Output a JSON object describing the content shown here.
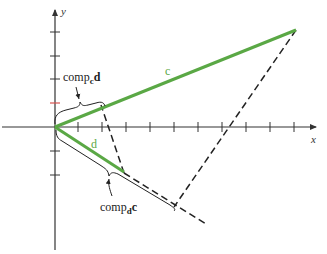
{
  "diagram": {
    "axes": {
      "x_label": "x",
      "y_label": "y",
      "origin": [
        55,
        127
      ],
      "x_ticks_px": [
        78,
        102,
        126,
        150,
        174,
        198,
        222,
        246,
        270,
        294
      ],
      "y_ticks_px": [
        32,
        56,
        79,
        103,
        151,
        175
      ],
      "highlight_tick_y_px": 103,
      "highlight_tick_color": "#d9534f",
      "axis_color": "#333333"
    },
    "vectors": {
      "c": {
        "label": "c",
        "tip": [
          296,
          30
        ],
        "color": "#5aa845"
      },
      "d": {
        "label": "d",
        "tip": [
          124,
          172
        ],
        "color": "#5aa845"
      }
    },
    "annotations": {
      "comp_c_d": {
        "prefix": "comp",
        "sub": "c",
        "suffix": "d"
      },
      "comp_d_c": {
        "prefix": "comp",
        "sub": "d",
        "suffix": "c"
      }
    },
    "colors": {
      "vector": "#5aa845",
      "line": "#222222",
      "highlight": "#d9534f"
    }
  }
}
